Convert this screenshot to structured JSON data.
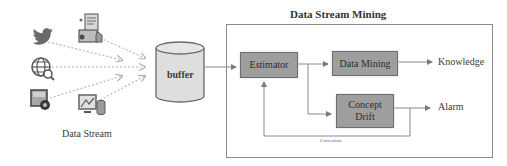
{
  "diagram": {
    "title": "Data Stream Mining",
    "sources": {
      "label": "Data Stream",
      "icons": [
        "twitter-bird-icon",
        "document-report-icon",
        "globe-search-icon",
        "photo-settings-icon",
        "monitor-chart-database-icon"
      ]
    },
    "buffer": {
      "label": "buffer"
    },
    "nodes": {
      "estimator": "Estimator",
      "data_mining": "Data Mining",
      "concept_drift_line1": "Concept",
      "concept_drift_line2": "Drift"
    },
    "outputs": {
      "knowledge": "Knowledge",
      "alarm": "Alarm"
    },
    "feedback": {
      "label": "Correction"
    },
    "colors": {
      "box_fill": "#9e9e9e",
      "box_border": "#6e6e6e",
      "line": "#8a8a8a",
      "icon": "#6a6a6a"
    }
  }
}
